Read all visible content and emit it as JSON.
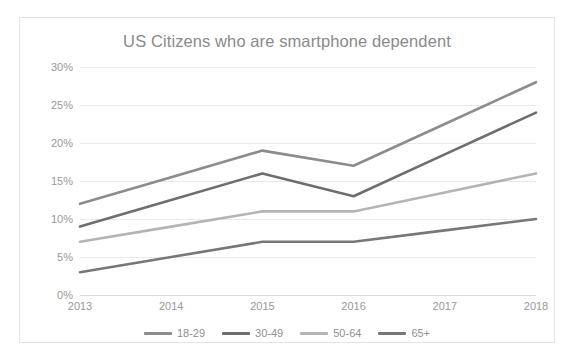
{
  "chart": {
    "title": "US Citizens who are smartphone dependent"
  },
  "legend": {
    "position": "bottom",
    "items": [
      {
        "label": "18-29",
        "color": "#8c8c8c"
      },
      {
        "label": "30-49",
        "color": "#6e6e6e"
      },
      {
        "label": "50-64",
        "color": "#b4b4b4"
      },
      {
        "label": "65+",
        "color": "#777777"
      }
    ]
  },
  "axes": {
    "y_ticks": [
      "0%",
      "5%",
      "10%",
      "15%",
      "20%",
      "25%",
      "30%"
    ],
    "x_ticks": [
      "2013",
      "2014",
      "2015",
      "2016",
      "2017",
      "2018"
    ]
  },
  "chart_data": {
    "type": "line",
    "title": "US Citizens who are smartphone dependent",
    "xlabel": "",
    "ylabel": "",
    "categories": [
      "2013",
      "2014",
      "2015",
      "2016",
      "2017",
      "2018"
    ],
    "x": [
      2013,
      2014,
      2015,
      2016,
      2017,
      2018
    ],
    "ylim": [
      0,
      30
    ],
    "yticks": [
      0,
      5,
      10,
      15,
      20,
      25,
      30
    ],
    "ytick_labels": [
      "0%",
      "5%",
      "10%",
      "15%",
      "20%",
      "25%",
      "30%"
    ],
    "grid": true,
    "legend_position": "bottom",
    "series": [
      {
        "name": "18-29",
        "color": "#8c8c8c",
        "values": [
          12,
          15.5,
          19,
          17,
          22.5,
          28
        ]
      },
      {
        "name": "30-49",
        "color": "#6e6e6e",
        "values": [
          9,
          12.5,
          16,
          13,
          18.5,
          24
        ]
      },
      {
        "name": "50-64",
        "color": "#b4b4b4",
        "values": [
          7,
          9,
          11,
          11,
          13.5,
          16
        ]
      },
      {
        "name": "65+",
        "color": "#777777",
        "values": [
          3,
          5,
          7,
          7,
          8.5,
          10
        ]
      }
    ]
  }
}
